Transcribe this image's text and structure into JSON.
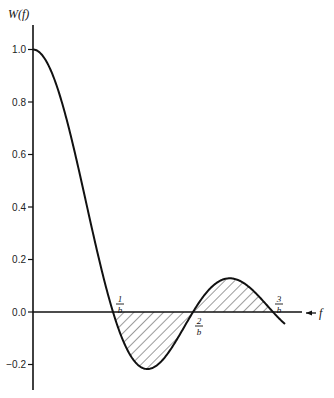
{
  "chart_data": {
    "type": "line",
    "title": "",
    "ylabel": "W(f)",
    "xlabel": "f",
    "ylim": [
      -0.3,
      1.1
    ],
    "yticks": [
      1.0,
      0.8,
      0.6,
      0.4,
      0.2,
      0.0,
      -0.2
    ],
    "ytick_labels": [
      "1.0",
      "0.8",
      "0.6",
      "0.4",
      "0.2",
      "0.0",
      "−0.2"
    ],
    "xtick_labels": [
      {
        "num": "1",
        "den": "b",
        "x": 1
      },
      {
        "num": "2",
        "den": "b",
        "x": 2
      },
      {
        "num": "3",
        "den": "b",
        "x": 3
      }
    ],
    "function": "sin(pi*f*b)/(pi*f*b)",
    "x_range_in_units_of_1_over_b": [
      0,
      3.15
    ],
    "shaded_regions": [
      {
        "from": 1,
        "to": 2,
        "sign": "negative"
      },
      {
        "from": 2,
        "to": 3,
        "sign": "positive"
      }
    ],
    "series": [
      {
        "name": "W(f)",
        "x": [
          0,
          0.25,
          0.5,
          0.75,
          1.0,
          1.25,
          1.43,
          1.5,
          1.75,
          2.0,
          2.25,
          2.46,
          2.5,
          2.75,
          3.0,
          3.15
        ],
        "values": [
          1.0,
          0.9,
          0.637,
          0.3,
          0.0,
          -0.18,
          -0.217,
          -0.212,
          -0.129,
          0.0,
          0.1,
          0.128,
          0.127,
          0.082,
          0.0,
          -0.05
        ]
      }
    ],
    "grid": false,
    "legend": null
  }
}
